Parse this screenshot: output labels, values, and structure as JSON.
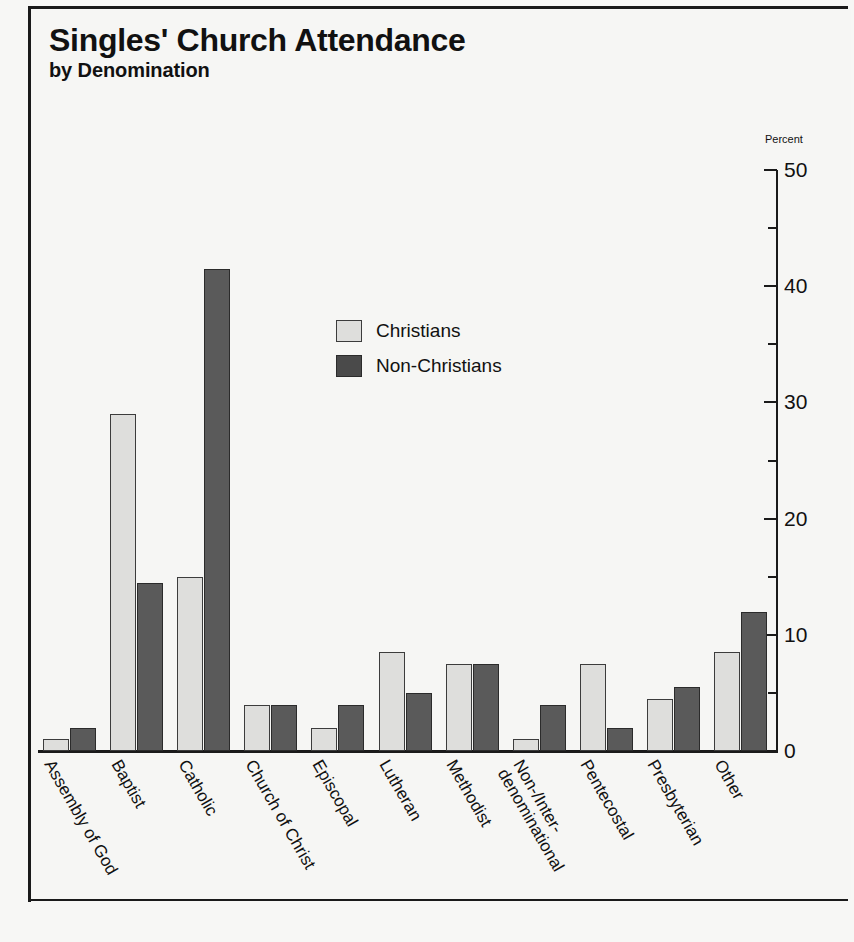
{
  "title": {
    "main": "Singles' Church Attendance",
    "sub": "by Denomination"
  },
  "axis": {
    "unit_label": "Percent",
    "ticks": [
      "50",
      "40",
      "30",
      "20",
      "10",
      "0"
    ]
  },
  "legend": {
    "items": [
      {
        "label": "Christians",
        "swatch": "light-gray-swatch",
        "color": "#dededc"
      },
      {
        "label": "Non-Christians",
        "swatch": "dark-gray-swatch",
        "color": "#4a4a4a"
      }
    ]
  },
  "categories_display": [
    {
      "line1": "Assembly of God",
      "line2": ""
    },
    {
      "line1": "Baptist",
      "line2": ""
    },
    {
      "line1": "Catholic",
      "line2": ""
    },
    {
      "line1": "Church of Christ",
      "line2": ""
    },
    {
      "line1": "Episcopal",
      "line2": ""
    },
    {
      "line1": "Lutheran",
      "line2": ""
    },
    {
      "line1": "Methodist",
      "line2": ""
    },
    {
      "line1": "Non-/Inter-",
      "line2": "denominational"
    },
    {
      "line1": "Pentecostal",
      "line2": ""
    },
    {
      "line1": "Presbyterian",
      "line2": ""
    },
    {
      "line1": "Other",
      "line2": ""
    }
  ],
  "chart_data": {
    "type": "bar",
    "title": "Singles' Church Attendance by Denomination",
    "xlabel": "",
    "ylabel": "Percent",
    "ylim": [
      0,
      50
    ],
    "ytick_values": [
      0,
      10,
      20,
      30,
      40,
      50
    ],
    "yminor_step": 5,
    "grid": false,
    "legend_position": "center",
    "axis_side": "right",
    "categories": [
      "Assembly of God",
      "Baptist",
      "Catholic",
      "Church of Christ",
      "Episcopal",
      "Lutheran",
      "Methodist",
      "Non-/Inter-denominational",
      "Pentecostal",
      "Presbyterian",
      "Other"
    ],
    "series": [
      {
        "name": "Christians",
        "color": "#dededc",
        "values": [
          1,
          29,
          15,
          4,
          2,
          8.5,
          7.5,
          1,
          7.5,
          4.5,
          8.5
        ]
      },
      {
        "name": "Non-Christians",
        "color": "#4a4a4a",
        "values": [
          2,
          14.5,
          41.5,
          4,
          4,
          5,
          7.5,
          4,
          2,
          5.5,
          12
        ]
      }
    ]
  }
}
